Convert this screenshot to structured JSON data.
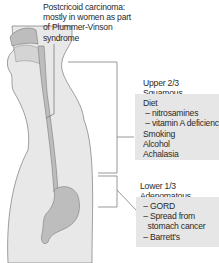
{
  "figure": {
    "colors": {
      "body_fill": "#e8e8e8",
      "organ_fill": "#bdbdbd",
      "outline": "#7a7a7a",
      "box_fill": "#e6e6e6",
      "leader_line": "#6e6e6e"
    }
  },
  "annotations": {
    "postcricoid": {
      "lines": [
        "Postcricoid carcinoma:",
        "mostly in women as part",
        "of Plummer-Vinson",
        "syndrome"
      ]
    },
    "upper": {
      "heading": "Upper 2/3 Squamous",
      "items": [
        "Diet",
        " – nitrosamines",
        " – vitamin A deficiency",
        "Smoking",
        "Alcohol",
        "Achalasia"
      ]
    },
    "lower": {
      "heading": "Lower 1/3 Adenomatous",
      "items": [
        " – GORD",
        " – Spread from",
        "   stomach cancer",
        " – Barrett's"
      ]
    }
  }
}
